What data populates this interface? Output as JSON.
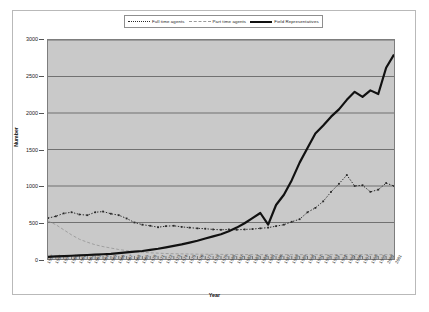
{
  "chart_data": {
    "type": "line",
    "title": "",
    "xlabel": "Year",
    "ylabel": "Number",
    "ylim": [
      0,
      3000
    ],
    "yticks": [
      0,
      500,
      1000,
      1500,
      2000,
      2500,
      3000
    ],
    "grid": true,
    "legend_position": "top-center",
    "x": [
      1957,
      1958,
      1959,
      1960,
      1961,
      1962,
      1963,
      1964,
      1965,
      1966,
      1967,
      1968,
      1969,
      1970,
      1971,
      1972,
      1973,
      1974,
      1975,
      1976,
      1977,
      1978,
      1979,
      1980,
      1981,
      1982,
      1983,
      1984,
      1985,
      1986,
      1987,
      1988,
      1989,
      1990,
      1991,
      1992,
      1993,
      1994,
      1995,
      1996,
      1997,
      1998,
      1999,
      2000,
      2001
    ],
    "series": [
      {
        "name": "Full time agents",
        "style": "dotted-markers",
        "color": "#2a2a2a",
        "values": [
          560,
          585,
          625,
          640,
          610,
          600,
          640,
          650,
          620,
          600,
          555,
          500,
          470,
          455,
          435,
          450,
          455,
          440,
          430,
          420,
          415,
          405,
          400,
          405,
          400,
          405,
          410,
          420,
          430,
          450,
          470,
          510,
          545,
          640,
          700,
          790,
          920,
          1030,
          1150,
          1000,
          1010,
          920,
          950,
          1040,
          1000
        ]
      },
      {
        "name": "Part time agents",
        "style": "dashed",
        "color": "#9a9a9a",
        "values": [
          520,
          470,
          400,
          330,
          270,
          230,
          195,
          170,
          150,
          130,
          115,
          100,
          92,
          85,
          80,
          75,
          72,
          70,
          68,
          66,
          65,
          64,
          63,
          62,
          62,
          61,
          60,
          60,
          60,
          60,
          60,
          60,
          60,
          60,
          60,
          60,
          60,
          60,
          60,
          60,
          60,
          60,
          60,
          60,
          60
        ]
      },
      {
        "name": "Field Representatives",
        "style": "solid-thick",
        "color": "#111111",
        "values": [
          30,
          35,
          40,
          45,
          50,
          55,
          60,
          65,
          70,
          80,
          90,
          100,
          110,
          125,
          140,
          160,
          180,
          200,
          225,
          250,
          280,
          310,
          340,
          380,
          430,
          490,
          560,
          630,
          470,
          740,
          880,
          1080,
          1320,
          1520,
          1720,
          1830,
          1950,
          2050,
          2180,
          2290,
          2220,
          2310,
          2260,
          2620,
          2800
        ]
      }
    ],
    "legend": [
      {
        "label": "Full time agents",
        "key": "dotted"
      },
      {
        "label": "Part time agents",
        "key": "dashed"
      },
      {
        "label": "Field Representatives",
        "key": "solid"
      }
    ]
  }
}
